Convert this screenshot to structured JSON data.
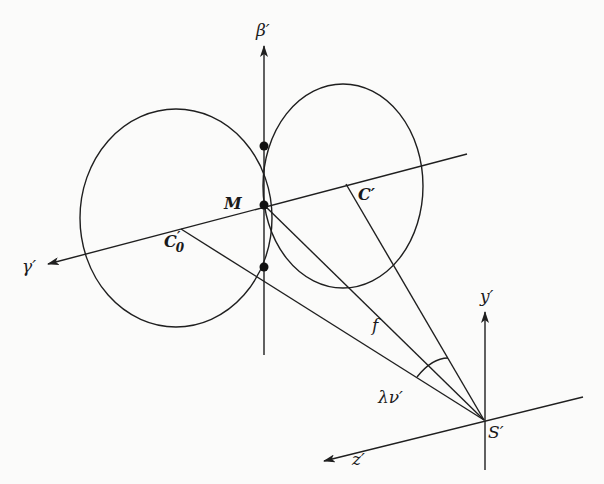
{
  "figure": {
    "labels": {
      "beta_axis": "β′",
      "gamma_axis": "γ′",
      "point_M": "M",
      "point_C": "C′",
      "point_C0": "C",
      "point_C0_sub": "0",
      "point_C0_prime": "′",
      "focal_f": "f",
      "lambda_nu": "λν′",
      "y_axis": "y′",
      "z_axis": "z′",
      "point_S": "S′"
    },
    "colors": {
      "ink": "#1f1f1f",
      "background": "#fbfbfa"
    }
  }
}
